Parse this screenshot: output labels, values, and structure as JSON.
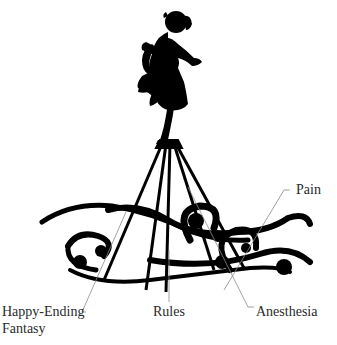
{
  "figure": {
    "colors": {
      "ink": "#000000",
      "background": "#ffffff",
      "leader": "#8a8a8a",
      "label_text": "#2a2a2a"
    }
  },
  "labels": {
    "pain": "Pain",
    "happy_ending_line1": "Happy-Ending",
    "happy_ending_line2": "Fantasy",
    "rules": "Rules",
    "anesthesia": "Anesthesia"
  }
}
